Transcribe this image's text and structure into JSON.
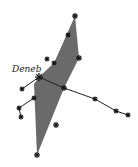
{
  "diagram": {
    "title_label": "Deneb",
    "fill_color": "#6a6a6a",
    "line_color": "#222222",
    "polygon": [
      [
        75,
        16
      ],
      [
        79,
        58
      ],
      [
        64,
        88
      ],
      [
        37,
        155
      ],
      [
        34,
        84
      ],
      [
        39,
        77
      ],
      [
        54,
        63
      ]
    ],
    "stars": [
      {
        "name": "deneb",
        "x": 39,
        "y": 77,
        "size": 4
      },
      {
        "name": "star-top",
        "x": 75,
        "y": 16,
        "size": 3
      },
      {
        "name": "star-upper",
        "x": 68,
        "y": 35,
        "size": 2.5
      },
      {
        "name": "star-right",
        "x": 79,
        "y": 58,
        "size": 3
      },
      {
        "name": "star-mid-left",
        "x": 54,
        "y": 63,
        "size": 2.5
      },
      {
        "name": "star-outer-left",
        "x": 47,
        "y": 59,
        "size": 2.5
      },
      {
        "name": "star-center",
        "x": 64,
        "y": 88,
        "size": 3
      },
      {
        "name": "star-wing-1",
        "x": 22,
        "y": 89,
        "size": 2.5
      },
      {
        "name": "star-wing-2",
        "x": 34,
        "y": 98,
        "size": 2.5
      },
      {
        "name": "star-wing-3",
        "x": 19,
        "y": 108,
        "size": 2.5
      },
      {
        "name": "star-wing-4",
        "x": 21,
        "y": 117,
        "size": 2.5
      },
      {
        "name": "star-lower",
        "x": 56,
        "y": 125,
        "size": 3
      },
      {
        "name": "star-bottom",
        "x": 37,
        "y": 155,
        "size": 3
      },
      {
        "name": "star-tail-1",
        "x": 95,
        "y": 99,
        "size": 2.5
      },
      {
        "name": "star-tail-2",
        "x": 116,
        "y": 111,
        "size": 2.5
      },
      {
        "name": "star-tail-3",
        "x": 128,
        "y": 115,
        "size": 2.5
      }
    ],
    "lines": [
      [
        [
          39,
          77
        ],
        [
          64,
          88
        ]
      ],
      [
        [
          64,
          88
        ],
        [
          95,
          99
        ]
      ],
      [
        [
          95,
          99
        ],
        [
          116,
          111
        ]
      ],
      [
        [
          116,
          111
        ],
        [
          128,
          115
        ]
      ],
      [
        [
          39,
          77
        ],
        [
          22,
          89
        ]
      ],
      [
        [
          34,
          98
        ],
        [
          19,
          108
        ]
      ],
      [
        [
          19,
          108
        ],
        [
          21,
          117
        ]
      ]
    ]
  }
}
